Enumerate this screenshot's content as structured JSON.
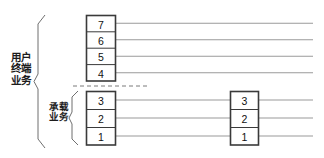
{
  "diagram": {
    "labels": {
      "user_terminal_service": "用户\n终端\n业务",
      "bearer_service": "承载\n业务"
    },
    "stacks": [
      {
        "id": "upper-layer-stack",
        "name": "用户终端业务层",
        "cells": [
          "7",
          "6",
          "5",
          "4"
        ]
      },
      {
        "id": "lower-layer-stack",
        "name": "承载业务层",
        "cells": [
          "3",
          "2",
          "1"
        ]
      },
      {
        "id": "remote-layer-stack",
        "name": "对端承载业务层",
        "cells": [
          "3",
          "2",
          "1"
        ]
      }
    ],
    "divider": {
      "name": "dashed-separator",
      "style": "dashed"
    },
    "colors": {
      "stroke": "#2b2b2b",
      "line": "#8c8c8c",
      "text": "#111111",
      "background": "#ffffff"
    }
  }
}
